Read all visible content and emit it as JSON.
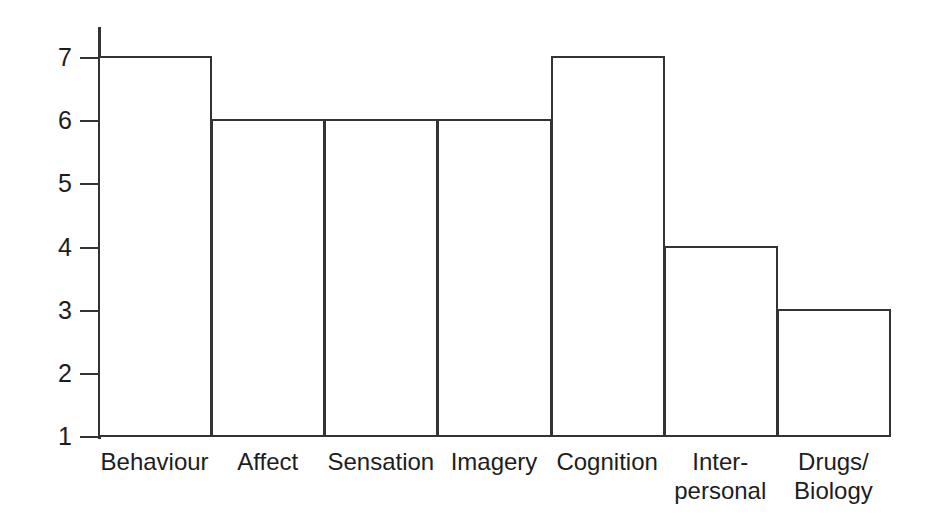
{
  "chart_data": {
    "type": "bar",
    "title": "",
    "subtitle": "",
    "xlabel": "",
    "ylabel": "",
    "categories": [
      "Behaviour",
      "Affect",
      "Sensation",
      "Imagery",
      "Cognition",
      "Inter-\npersonal",
      "Drugs/\nBiology"
    ],
    "values": [
      7,
      6,
      6,
      6,
      7,
      4,
      3
    ],
    "ylim": [
      1,
      7
    ],
    "ytick_labels": [
      "7",
      "6",
      "5",
      "4",
      "3",
      "2",
      "1"
    ],
    "ytick_values": [
      7,
      6,
      5,
      4,
      3,
      2,
      1
    ],
    "grid": false,
    "legend": null,
    "legend_position": "none",
    "bar_fill_color": "#ffffff",
    "bar_edge_color": "#333333",
    "axis_color": "#333333",
    "text_color": "#1d1d1d",
    "background_color": "#ffffff",
    "bars_adjacent": true,
    "annotations": []
  }
}
